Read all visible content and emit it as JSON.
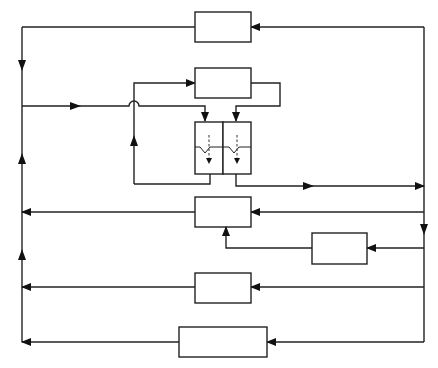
{
  "diagram": {
    "type": "block-flow-diagram",
    "blocks": [
      {
        "id": "top-block",
        "label": ""
      },
      {
        "id": "upper-block",
        "label": ""
      },
      {
        "id": "split-block-left",
        "label": ""
      },
      {
        "id": "split-block-right",
        "label": ""
      },
      {
        "id": "middle-block",
        "label": ""
      },
      {
        "id": "small-right-block",
        "label": ""
      },
      {
        "id": "lower-block",
        "label": ""
      },
      {
        "id": "bottom-block",
        "label": ""
      }
    ],
    "colors": {
      "line": "#222222",
      "background": "#ffffff"
    }
  }
}
